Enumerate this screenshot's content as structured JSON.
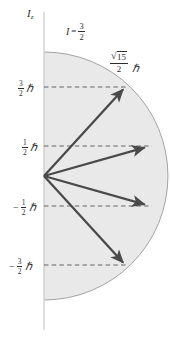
{
  "figure": {
    "name": "nuclear-spin-vector-model",
    "axis_label": {
      "symbol": "I",
      "subscript": "z"
    },
    "spin_label": {
      "symbol": "I",
      "equals": "=",
      "numerator": "3",
      "denominator": "2"
    },
    "radius_label": {
      "radical_sign": "√",
      "radicand": "15",
      "denominator": "2",
      "hbar": "ℏ"
    },
    "colors": {
      "shade_fill": "#e9e9e9",
      "circle_stroke": "#9a9a9a",
      "axis_stroke": "#c9c9c9",
      "vector_stroke": "#4a4a4a",
      "dashed_stroke": "#5a5a5a",
      "text": "#2e2e2e",
      "background": "#ffffff"
    },
    "geometry": {
      "origin_x": 44,
      "origin_y": 176,
      "radius": 124,
      "axis_top_y": 12,
      "axis_bottom_y": 330
    },
    "ticks": [
      {
        "sign": "",
        "numerator": "3",
        "denominator": "2",
        "hbar": "ℏ",
        "value": 1.5,
        "y": 87,
        "label_x": 16,
        "tip_x": 125.7
      },
      {
        "sign": "",
        "numerator": "1",
        "denominator": "2",
        "hbar": "ℏ",
        "value": 0.5,
        "y": 146,
        "label_x": 20,
        "tip_x": 148.3
      },
      {
        "sign": "−",
        "numerator": "1",
        "denominator": "2",
        "hbar": "ℏ",
        "value": -0.5,
        "y": 206,
        "label_x": 13,
        "tip_x": 148.3
      },
      {
        "sign": "−",
        "numerator": "3",
        "denominator": "2",
        "hbar": "ℏ",
        "value": -1.5,
        "y": 265,
        "label_x": 9,
        "tip_x": 125.7
      }
    ],
    "vectors": [
      {
        "name": "spin-vector-plus-3-2",
        "mz": "3/2",
        "x2": 125.7,
        "y2": 87
      },
      {
        "name": "spin-vector-plus-1-2",
        "mz": "1/2",
        "x2": 148.3,
        "y2": 146
      },
      {
        "name": "spin-vector-minus-1-2",
        "mz": "-1/2",
        "x2": 148.3,
        "y2": 206
      },
      {
        "name": "spin-vector-minus-3-2",
        "mz": "-3/2",
        "x2": 125.7,
        "y2": 265
      }
    ]
  }
}
